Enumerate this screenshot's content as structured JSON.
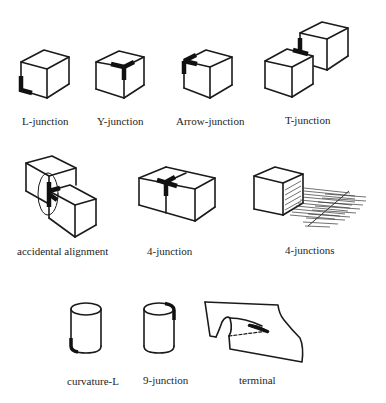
{
  "figure": {
    "rows": [
      {
        "items": [
          {
            "id": "l-junction",
            "label": "L-junction"
          },
          {
            "id": "y-junction",
            "label": "Y-junction"
          },
          {
            "id": "arrow-junction",
            "label": "Arrow-junction"
          },
          {
            "id": "t-junction",
            "label": "T-junction"
          }
        ]
      },
      {
        "items": [
          {
            "id": "accidental-alignment",
            "label": "accidental alignment"
          },
          {
            "id": "4-junction",
            "label": "4-junction"
          },
          {
            "id": "4-junctions",
            "label": "4-junctions"
          }
        ]
      },
      {
        "items": [
          {
            "id": "curvature-l",
            "label": "curvature-L"
          },
          {
            "id": "9-junction",
            "label": "9-junction"
          },
          {
            "id": "terminal",
            "label": "terminal"
          }
        ]
      }
    ],
    "colors": {
      "background": "#ffffff",
      "line": "#1a1a1a",
      "highlight": "#111111"
    }
  }
}
